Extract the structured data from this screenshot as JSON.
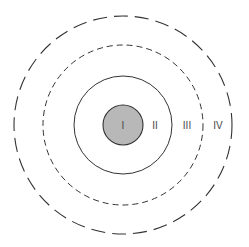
{
  "diagram": {
    "type": "concentric-circles",
    "center": [
      123,
      125
    ],
    "colors": {
      "stroke": "#333333",
      "inner_fill": "#b8b8b8",
      "background": "#ffffff"
    },
    "rings": [
      {
        "id": "I",
        "label": "I",
        "radius": 20,
        "style": "solid-filled"
      },
      {
        "id": "II",
        "label": "II",
        "radius": 49,
        "style": "solid"
      },
      {
        "id": "III",
        "label": "III",
        "radius": 80,
        "style": "short-dashed"
      },
      {
        "id": "IV",
        "label": "IV",
        "radius": 109,
        "style": "long-dashed"
      }
    ],
    "labels": {
      "zone_1": "I",
      "zone_2": "II",
      "zone_3": "III",
      "zone_4": "IV"
    }
  }
}
